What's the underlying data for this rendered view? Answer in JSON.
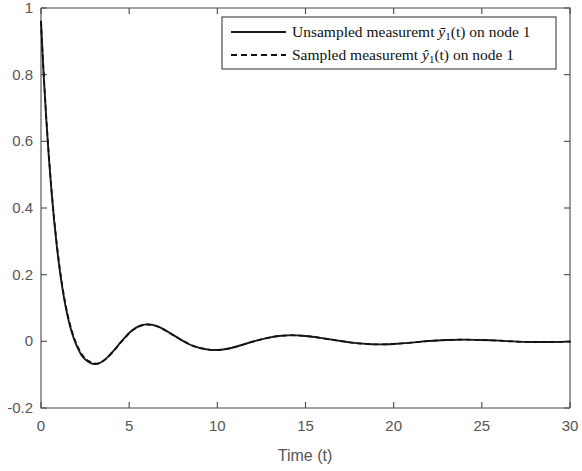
{
  "chart_data": {
    "type": "line",
    "title": "",
    "xlabel": "Time (t)",
    "ylabel": "",
    "xlim": [
      0,
      30
    ],
    "ylim": [
      -0.2,
      1.0
    ],
    "xticks": [
      "0",
      "5",
      "10",
      "15",
      "20",
      "25",
      "30"
    ],
    "xtick_values": [
      0,
      5,
      10,
      15,
      20,
      25,
      30
    ],
    "yticks": [
      "1",
      "0.8",
      "0.6",
      "0.4",
      "0.2",
      "0",
      "-0.2"
    ],
    "ytick_values": [
      1,
      0.8,
      0.6,
      0.4,
      0.2,
      0,
      -0.2
    ],
    "grid": false,
    "legend_position": "top-right",
    "series": [
      {
        "name": "Unsampled measuremt ȳ₁(t) on node 1",
        "style": "solid",
        "color": "#1a1a1a",
        "x": [
          0,
          0.15,
          0.3,
          0.45,
          0.6,
          0.75,
          0.9,
          1.05,
          1.2,
          1.35,
          1.5,
          1.65,
          1.8,
          1.95,
          2.1,
          2.25,
          2.4,
          2.55,
          2.7,
          2.85,
          3,
          3.25,
          3.5,
          3.75,
          4,
          4.25,
          4.5,
          4.75,
          5,
          5.25,
          5.5,
          5.75,
          6,
          6.25,
          6.5,
          6.75,
          7,
          7.25,
          7.5,
          7.75,
          8,
          8.25,
          8.5,
          8.75,
          9,
          9.5,
          10,
          10.5,
          11,
          11.5,
          12,
          12.5,
          13,
          13.5,
          14,
          14.5,
          15,
          15.5,
          16,
          16.5,
          17,
          17.5,
          18,
          18.5,
          19,
          19.5,
          20,
          21,
          22,
          23,
          24,
          25,
          26,
          27,
          28,
          29,
          30
        ],
        "y": [
          0.96,
          0.8,
          0.665,
          0.548,
          0.447,
          0.359,
          0.284,
          0.219,
          0.164,
          0.117,
          0.078,
          0.045,
          0.018,
          -0.004,
          -0.022,
          -0.037,
          -0.048,
          -0.056,
          -0.062,
          -0.066,
          -0.068,
          -0.067,
          -0.06,
          -0.049,
          -0.035,
          -0.02,
          -0.004,
          0.011,
          0.025,
          0.036,
          0.044,
          0.049,
          0.051,
          0.05,
          0.047,
          0.042,
          0.035,
          0.027,
          0.019,
          0.011,
          0.003,
          -0.004,
          -0.011,
          -0.016,
          -0.02,
          -0.025,
          -0.026,
          -0.023,
          -0.017,
          -0.009,
          -0.001,
          0.006,
          0.012,
          0.016,
          0.018,
          0.018,
          0.016,
          0.013,
          0.009,
          0.005,
          0.001,
          -0.003,
          -0.006,
          -0.008,
          -0.009,
          -0.009,
          -0.008,
          -0.004,
          0.001,
          0.004,
          0.005,
          0.004,
          0.002,
          -0.001,
          -0.002,
          -0.002,
          -0.001
        ]
      },
      {
        "name": "Sampled measuremt ŷ₁(t) on node 1",
        "style": "dashed",
        "color": "#111111",
        "x": [
          0,
          0.15,
          0.3,
          0.45,
          0.6,
          0.75,
          0.9,
          1.05,
          1.2,
          1.35,
          1.5,
          1.65,
          1.8,
          1.95,
          2.1,
          2.25,
          2.4,
          2.55,
          2.7,
          2.85,
          3,
          3.25,
          3.5,
          3.75,
          4,
          4.25,
          4.5,
          4.75,
          5,
          5.25,
          5.5,
          5.75,
          6,
          6.25,
          6.5,
          6.75,
          7,
          7.25,
          7.5,
          7.75,
          8,
          8.25,
          8.5,
          8.75,
          9,
          9.5,
          10,
          10.5,
          11,
          11.5,
          12,
          12.5,
          13,
          13.5,
          14,
          14.5,
          15,
          15.5,
          16,
          16.5,
          17,
          17.5,
          18,
          18.5,
          19,
          19.5,
          20,
          21,
          22,
          23,
          24,
          25,
          26,
          27,
          28,
          29,
          30
        ],
        "y": [
          0.96,
          0.806,
          0.672,
          0.556,
          0.454,
          0.366,
          0.29,
          0.225,
          0.17,
          0.123,
          0.083,
          0.05,
          0.023,
          0.0,
          -0.018,
          -0.033,
          -0.045,
          -0.053,
          -0.059,
          -0.063,
          -0.066,
          -0.066,
          -0.06,
          -0.05,
          -0.036,
          -0.021,
          -0.005,
          0.01,
          0.024,
          0.035,
          0.043,
          0.048,
          0.05,
          0.049,
          0.046,
          0.041,
          0.034,
          0.026,
          0.018,
          0.01,
          0.002,
          -0.005,
          -0.011,
          -0.016,
          -0.02,
          -0.025,
          -0.026,
          -0.023,
          -0.017,
          -0.009,
          -0.001,
          0.006,
          0.012,
          0.016,
          0.018,
          0.018,
          0.016,
          0.013,
          0.009,
          0.005,
          0.001,
          -0.003,
          -0.006,
          -0.008,
          -0.009,
          -0.009,
          -0.008,
          -0.004,
          0.001,
          0.004,
          0.005,
          0.004,
          0.002,
          -0.001,
          -0.002,
          -0.002,
          -0.001
        ]
      }
    ],
    "legend": [
      {
        "prefix": "Unsampled measuremt ",
        "var": "y",
        "accent": "bar",
        "sub": "1",
        "suffix": "(t) on node 1",
        "style": "solid"
      },
      {
        "prefix": "Sampled measuremt ",
        "var": "y",
        "accent": "hat",
        "sub": "1",
        "suffix": "(t) on node 1",
        "style": "dashed"
      }
    ]
  },
  "axes": {
    "xlabel": "Time (t)"
  }
}
